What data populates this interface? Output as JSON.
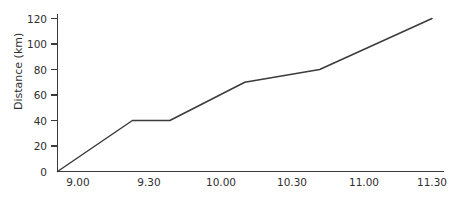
{
  "chart_data": {
    "type": "line",
    "title": "",
    "xlabel": "",
    "ylabel": "Distance (km)",
    "x": [
      "9.00",
      "9.30",
      "9.45",
      "10.15",
      "10.45",
      "11.30"
    ],
    "values": [
      0,
      40,
      40,
      70,
      80,
      120
    ],
    "series": [
      {
        "name": "Distance",
        "points": [
          {
            "x": "9.00",
            "y": 0
          },
          {
            "x": "9.30",
            "y": 40
          },
          {
            "x": "9.45",
            "y": 40
          },
          {
            "x": "10.15",
            "y": 70
          },
          {
            "x": "10.45",
            "y": 80
          },
          {
            "x": "11.30",
            "y": 120
          }
        ]
      }
    ],
    "xticklabels": [
      "9.00",
      "9.30",
      "10.00",
      "10.30",
      "11.00",
      "11.30"
    ],
    "yticklabels": [
      "0",
      "20",
      "40",
      "60",
      "80",
      "100",
      "120"
    ],
    "yticks": [
      0,
      20,
      40,
      60,
      80,
      100,
      120
    ],
    "ylim": [
      0,
      128
    ],
    "xlim": [
      "9.00",
      "11.30"
    ],
    "grid": false,
    "legend": false,
    "legend_position": "none",
    "line_color": "#3b3b3b",
    "axis_color": "#3a3a3a",
    "background_color": "#ffffff"
  },
  "axis": {
    "y_label": "Distance (km)",
    "y_ticks": [
      {
        "label": "120",
        "value": 120
      },
      {
        "label": "100",
        "value": 100
      },
      {
        "label": "80",
        "value": 80
      },
      {
        "label": "60",
        "value": 60
      },
      {
        "label": "40",
        "value": 40
      },
      {
        "label": "20",
        "value": 20
      },
      {
        "label": "0",
        "value": 0
      }
    ],
    "x_ticks": [
      {
        "label": "9.00"
      },
      {
        "label": "9.30"
      },
      {
        "label": "10.00"
      },
      {
        "label": "10.30"
      },
      {
        "label": "11.00"
      },
      {
        "label": "11.30"
      }
    ]
  }
}
